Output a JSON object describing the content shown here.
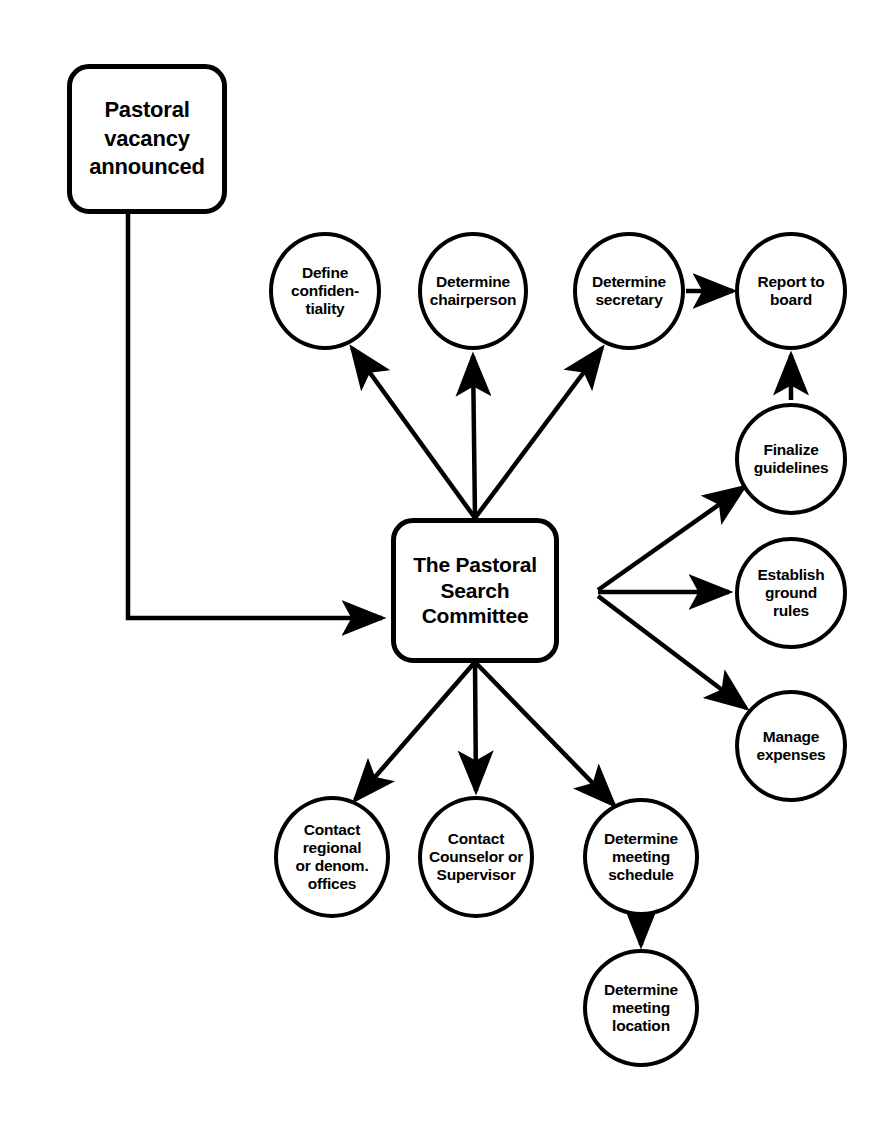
{
  "diagram": {
    "title": "The Pastoral Search Committee",
    "type": "flowchart",
    "background_color": "#ffffff",
    "stroke_color": "#000000",
    "text_color": "#000000",
    "nodes": [
      {
        "id": "pastoral_vacancy",
        "label": "Pastoral\nvacancy\nannounced",
        "shape": "rounded-box",
        "cx": 147,
        "cy": 139,
        "width": 160,
        "height": 150
      },
      {
        "id": "hub",
        "label": "The Pastoral\nSearch\nCommittee",
        "shape": "rounded-box",
        "cx": 475,
        "cy": 590,
        "width": 168,
        "height": 145
      },
      {
        "id": "define_confidentiality",
        "label": "Define\nconfiden-\ntiality",
        "shape": "circle",
        "cx": 325,
        "cy": 291,
        "width": 112,
        "height": 118
      },
      {
        "id": "determine_chairperson",
        "label": "Determine\nchairperson",
        "shape": "circle",
        "cx": 473,
        "cy": 291,
        "width": 110,
        "height": 118
      },
      {
        "id": "determine_secretary",
        "label": "Determine\nsecretary",
        "shape": "circle",
        "cx": 629,
        "cy": 291,
        "width": 112,
        "height": 118
      },
      {
        "id": "report_to_board",
        "label": "Report to\nboard",
        "shape": "circle",
        "cx": 791,
        "cy": 291,
        "width": 112,
        "height": 118
      },
      {
        "id": "finalize_guidelines",
        "label": "Finalize\nguidelines",
        "shape": "circle",
        "cx": 791,
        "cy": 459,
        "width": 112,
        "height": 112
      },
      {
        "id": "establish_ground_rules",
        "label": "Establish\nground\nrules",
        "shape": "circle",
        "cx": 791,
        "cy": 593,
        "width": 112,
        "height": 112
      },
      {
        "id": "manage_expenses",
        "label": "Manage\nexpenses",
        "shape": "circle",
        "cx": 791,
        "cy": 746,
        "width": 112,
        "height": 112
      },
      {
        "id": "contact_regional",
        "label": "Contact\nregional\nor denom.\noffices",
        "shape": "circle",
        "cx": 332,
        "cy": 857,
        "width": 116,
        "height": 122
      },
      {
        "id": "contact_counselor",
        "label": "Contact\nCounselor or\nSupervisor",
        "shape": "circle",
        "cx": 476,
        "cy": 857,
        "width": 116,
        "height": 122
      },
      {
        "id": "determine_meeting_schedule",
        "label": "Determine\nmeeting\nschedule",
        "shape": "circle",
        "cx": 641,
        "cy": 857,
        "width": 116,
        "height": 118
      },
      {
        "id": "determine_meeting_location",
        "label": "Determine\nmeeting\nlocation",
        "shape": "circle",
        "cx": 641,
        "cy": 1008,
        "width": 116,
        "height": 118
      }
    ],
    "edges": [
      {
        "id": "e-vacancy-hub",
        "from": "pastoral_vacancy",
        "to": "hub",
        "style": "elbow"
      },
      {
        "id": "e-hub-confidentiality",
        "from": "hub",
        "to": "define_confidentiality",
        "style": "straight"
      },
      {
        "id": "e-hub-chairperson",
        "from": "hub",
        "to": "determine_chairperson",
        "style": "straight"
      },
      {
        "id": "e-hub-secretary",
        "from": "hub",
        "to": "determine_secretary",
        "style": "straight"
      },
      {
        "id": "e-secretary-board",
        "from": "determine_secretary",
        "to": "report_to_board",
        "style": "straight"
      },
      {
        "id": "e-hub-finalize",
        "from": "hub",
        "to": "finalize_guidelines",
        "style": "straight"
      },
      {
        "id": "e-finalize-board",
        "from": "finalize_guidelines",
        "to": "report_to_board",
        "style": "straight"
      },
      {
        "id": "e-hub-groundrules",
        "from": "hub",
        "to": "establish_ground_rules",
        "style": "straight"
      },
      {
        "id": "e-hub-expenses",
        "from": "hub",
        "to": "manage_expenses",
        "style": "straight"
      },
      {
        "id": "e-hub-regional",
        "from": "hub",
        "to": "contact_regional",
        "style": "straight"
      },
      {
        "id": "e-hub-counselor",
        "from": "hub",
        "to": "contact_counselor",
        "style": "straight"
      },
      {
        "id": "e-hub-schedule",
        "from": "hub",
        "to": "determine_meeting_schedule",
        "style": "straight"
      },
      {
        "id": "e-schedule-location",
        "from": "determine_meeting_schedule",
        "to": "determine_meeting_location",
        "style": "straight"
      }
    ]
  }
}
